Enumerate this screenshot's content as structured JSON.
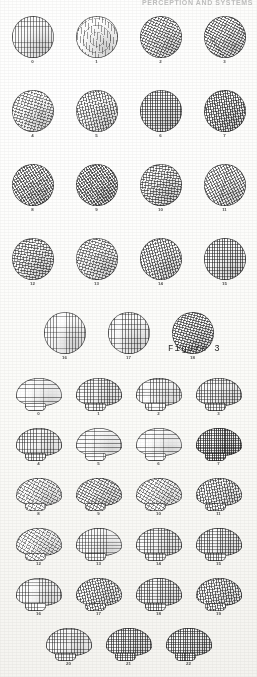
{
  "page": {
    "running_head": "PERCEPTION AND SYSTEMS",
    "background_color": "#fdfdfb",
    "ink_color": "#1d1d1d",
    "width": 257,
    "height": 677
  },
  "plates": [
    {
      "id": "plate-circles",
      "shape": "circle",
      "caption": "Figure 3",
      "rows": [
        {
          "items": [
            {
              "label": "0",
              "pattern": "fine-vertical-grid",
              "density": 0.34,
              "angle": 0,
              "tone": 0.3
            },
            {
              "label": "1",
              "pattern": "wavy-radial",
              "density": 0.22,
              "angle": 8,
              "tone": 0.18
            },
            {
              "label": "2",
              "pattern": "diagonal-wave",
              "density": 0.48,
              "angle": -22,
              "tone": 0.44
            },
            {
              "label": "3",
              "pattern": "diagonal-wave",
              "density": 0.5,
              "angle": -18,
              "tone": 0.46
            }
          ]
        },
        {
          "items": [
            {
              "label": "4",
              "pattern": "diagonal-wave",
              "density": 0.4,
              "angle": -28,
              "tone": 0.34
            },
            {
              "label": "5",
              "pattern": "cross-hatch",
              "density": 0.46,
              "angle": -12,
              "tone": 0.42
            },
            {
              "label": "6",
              "pattern": "cross-hatch",
              "density": 0.58,
              "angle": 0,
              "tone": 0.54
            },
            {
              "label": "7",
              "pattern": "cross-hatch",
              "density": 0.62,
              "angle": -8,
              "tone": 0.58
            }
          ]
        },
        {
          "items": [
            {
              "label": "8",
              "pattern": "cross-hatch",
              "density": 0.56,
              "angle": -32,
              "tone": 0.52
            },
            {
              "label": "9",
              "pattern": "cross-hatch",
              "density": 0.6,
              "angle": -34,
              "tone": 0.56
            },
            {
              "label": "10",
              "pattern": "diagonal-wave",
              "density": 0.52,
              "angle": -38,
              "tone": 0.48
            },
            {
              "label": "11",
              "pattern": "cross-hatch",
              "density": 0.5,
              "angle": -26,
              "tone": 0.46
            }
          ]
        },
        {
          "items": [
            {
              "label": "12",
              "pattern": "diagonal-wave",
              "density": 0.5,
              "angle": -36,
              "tone": 0.46
            },
            {
              "label": "13",
              "pattern": "diagonal-wave",
              "density": 0.46,
              "angle": -30,
              "tone": 0.4
            },
            {
              "label": "14",
              "pattern": "cross-hatch",
              "density": 0.52,
              "angle": -14,
              "tone": 0.48
            },
            {
              "label": "15",
              "pattern": "cross-hatch",
              "density": 0.54,
              "angle": 0,
              "tone": 0.5
            }
          ]
        },
        {
          "offset": true,
          "items": [
            {
              "label": "16",
              "pattern": "fine-vertical-grid",
              "density": 0.3,
              "angle": 0,
              "tone": 0.26
            },
            {
              "label": "17",
              "pattern": "fine-vertical-grid",
              "density": 0.4,
              "angle": 4,
              "tone": 0.36
            },
            {
              "label": "18",
              "pattern": "diagonal-wave",
              "density": 0.56,
              "angle": -30,
              "tone": 0.52
            }
          ]
        }
      ]
    },
    {
      "id": "plate-brains",
      "shape": "brain",
      "caption": "",
      "rows": [
        {
          "items": [
            {
              "label": "0",
              "pattern": "horizontal-band",
              "density": 0.3,
              "angle": 0,
              "tone": 0.26
            },
            {
              "label": "1",
              "pattern": "cross-hatch",
              "density": 0.44,
              "angle": 0,
              "tone": 0.4
            },
            {
              "label": "2",
              "pattern": "cross-hatch",
              "density": 0.4,
              "angle": 0,
              "tone": 0.36
            },
            {
              "label": "3",
              "pattern": "cross-hatch",
              "density": 0.46,
              "angle": 0,
              "tone": 0.42
            }
          ]
        },
        {
          "items": [
            {
              "label": "4",
              "pattern": "cross-hatch",
              "density": 0.42,
              "angle": 0,
              "tone": 0.38
            },
            {
              "label": "5",
              "pattern": "horizontal-band",
              "density": 0.34,
              "angle": 0,
              "tone": 0.3
            },
            {
              "label": "6",
              "pattern": "horizontal-band",
              "density": 0.3,
              "angle": 0,
              "tone": 0.26
            },
            {
              "label": "7",
              "pattern": "cross-hatch",
              "density": 0.7,
              "angle": 0,
              "tone": 0.66
            }
          ]
        },
        {
          "items": [
            {
              "label": "8",
              "pattern": "diagonal-wave",
              "density": 0.34,
              "angle": -16,
              "tone": 0.3
            },
            {
              "label": "9",
              "pattern": "diagonal-wave",
              "density": 0.44,
              "angle": -18,
              "tone": 0.4
            },
            {
              "label": "10",
              "pattern": "diagonal-wave",
              "density": 0.36,
              "angle": -14,
              "tone": 0.32
            },
            {
              "label": "11",
              "pattern": "cross-hatch",
              "density": 0.52,
              "angle": -10,
              "tone": 0.48
            }
          ]
        },
        {
          "items": [
            {
              "label": "12",
              "pattern": "diagonal-wave",
              "density": 0.32,
              "angle": -14,
              "tone": 0.28
            },
            {
              "label": "13",
              "pattern": "cross-hatch",
              "density": 0.36,
              "angle": 0,
              "tone": 0.32
            },
            {
              "label": "14",
              "pattern": "cross-hatch",
              "density": 0.44,
              "angle": 0,
              "tone": 0.4
            },
            {
              "label": "15",
              "pattern": "cross-hatch",
              "density": 0.5,
              "angle": 0,
              "tone": 0.46
            }
          ]
        },
        {
          "items": [
            {
              "label": "16",
              "pattern": "cross-hatch",
              "density": 0.38,
              "angle": 0,
              "tone": 0.34
            },
            {
              "label": "17",
              "pattern": "cross-hatch",
              "density": 0.52,
              "angle": -12,
              "tone": 0.48
            },
            {
              "label": "18",
              "pattern": "cross-hatch",
              "density": 0.5,
              "angle": 0,
              "tone": 0.46
            },
            {
              "label": "19",
              "pattern": "cross-hatch",
              "density": 0.54,
              "angle": -8,
              "tone": 0.5
            }
          ]
        },
        {
          "offset": true,
          "items": [
            {
              "label": "20",
              "pattern": "cross-hatch",
              "density": 0.42,
              "angle": 0,
              "tone": 0.38
            },
            {
              "label": "21",
              "pattern": "cross-hatch",
              "density": 0.6,
              "angle": 0,
              "tone": 0.56
            },
            {
              "label": "22",
              "pattern": "cross-hatch",
              "density": 0.62,
              "angle": 0,
              "tone": 0.58
            }
          ]
        }
      ]
    }
  ]
}
